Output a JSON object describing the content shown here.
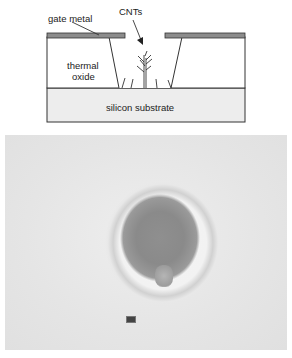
{
  "diagram": {
    "labels": {
      "gate_metal": "gate metal",
      "cnts": "CNTs",
      "thermal_oxide_line1": "thermal",
      "thermal_oxide_line2": "oxide",
      "silicon_substrate": "silicon substrate"
    },
    "colors": {
      "gate_metal": "#8c8c8c",
      "oxide": "#ffffff",
      "substrate": "#ededed",
      "outline": "#333333"
    }
  },
  "sem_image": {
    "description": "SEM micrograph of gated cavity with CNTs",
    "scale_bar_label": ""
  }
}
